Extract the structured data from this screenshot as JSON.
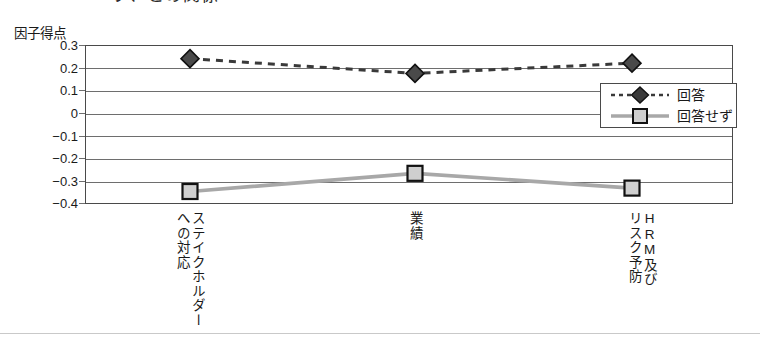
{
  "chart_title": "ブ、との関係",
  "y_axis_title": "因子得点",
  "bottom_rule": "",
  "legend": {
    "entries": [
      {
        "label": "回答",
        "marker": "diamond",
        "line": "dashed",
        "color": "#3a3a3a"
      },
      {
        "label": "回答せず",
        "marker": "square",
        "line": "solid",
        "color": "#9a9a9a"
      }
    ]
  },
  "x_labels": [
    {
      "col_main": "ステイクホルダー",
      "col_sub": "への対応"
    },
    {
      "col_main": "業績",
      "col_sub": ""
    },
    {
      "col_main": "HRM及び",
      "col_sub": "リスク予防"
    }
  ],
  "y_ticks": [
    "0.3",
    "0.2",
    "0.1",
    "0",
    "−0.1",
    "−0.2",
    "−0.3",
    "−0.4"
  ],
  "chart_data": {
    "type": "line",
    "title": "ブ、との関係",
    "xlabel": "",
    "ylabel": "因子得点",
    "ylim": [
      -0.4,
      0.3
    ],
    "ytick_values": [
      0.3,
      0.2,
      0.1,
      0,
      -0.1,
      -0.2,
      -0.3,
      -0.4
    ],
    "grid": true,
    "legend_position": "inside-right",
    "categories": [
      "ステイクホルダーへの対応",
      "業績",
      "HRM及びリスク予防"
    ],
    "series": [
      {
        "name": "回答",
        "values": [
          0.24,
          0.175,
          0.22
        ],
        "marker": "diamond",
        "linestyle": "dashed",
        "color": "#3a3a3a"
      },
      {
        "name": "回答せず",
        "values": [
          -0.345,
          -0.265,
          -0.33
        ],
        "marker": "square",
        "linestyle": "solid",
        "color": "#9a9a9a"
      }
    ]
  }
}
